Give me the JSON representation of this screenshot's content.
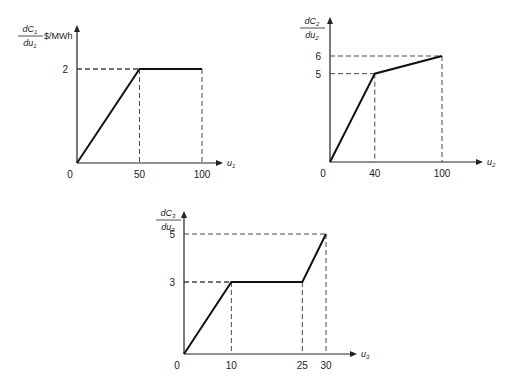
{
  "chart_data": [
    {
      "type": "line",
      "title": "",
      "ylabel_num": "dC1",
      "ylabel_den": "du1",
      "ylabel_sub": "1",
      "unit": "$/MWh",
      "xlabel": "u1",
      "xlabel_sub": "1",
      "points": [
        [
          0,
          0
        ],
        [
          50,
          2
        ],
        [
          100,
          2
        ]
      ],
      "xticks": [
        0,
        50,
        100
      ],
      "yticks": [
        2
      ],
      "xlim": [
        0,
        100
      ],
      "ylim": [
        0,
        2
      ],
      "grid": false
    },
    {
      "type": "line",
      "title": "",
      "ylabel_num": "dC2",
      "ylabel_den": "du2",
      "ylabel_sub": "2",
      "unit": "",
      "xlabel": "u2",
      "xlabel_sub": "2",
      "points": [
        [
          0,
          0
        ],
        [
          40,
          5
        ],
        [
          100,
          6
        ]
      ],
      "xticks": [
        0,
        40,
        100
      ],
      "yticks": [
        5,
        6
      ],
      "xlim": [
        0,
        100
      ],
      "ylim": [
        0,
        6
      ],
      "grid": false
    },
    {
      "type": "line",
      "title": "",
      "ylabel_num": "dC3",
      "ylabel_den": "du3",
      "ylabel_sub": "3",
      "unit": "",
      "xlabel": "u3",
      "xlabel_sub": "3",
      "points": [
        [
          0,
          0
        ],
        [
          10,
          3
        ],
        [
          25,
          3
        ],
        [
          30,
          5
        ]
      ],
      "xticks": [
        0,
        10,
        25,
        30
      ],
      "yticks": [
        3,
        5
      ],
      "xlim": [
        0,
        30
      ],
      "ylim": [
        0,
        5
      ],
      "grid": false
    }
  ]
}
